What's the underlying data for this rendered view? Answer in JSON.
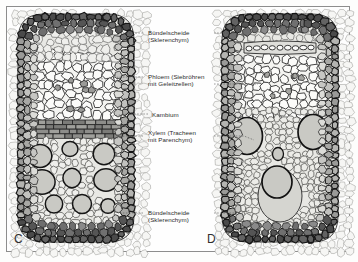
{
  "figure": {
    "background_color": "#fdfdfc",
    "frame_color": "#8d8d8d",
    "ink_color": "#2b2b2b"
  },
  "palette": {
    "sclerenchym_dark": "#3a3a3a",
    "sclerenchym_mid": "#8f8f8f",
    "parenchym_light": "#e8e8e4",
    "phloem_pale": "#f4f4f1",
    "xylem_fill": "#c9c9c4",
    "kambium_fill": "#9a9a96",
    "cavity_fill": "#d5d5d0",
    "outline": "#1e1e1e"
  },
  "labels": [
    {
      "id": "label-buendelscheide-top",
      "name": "Bündelscheide (Sklerenchym)",
      "lines": [
        "Bündelscheide",
        "(Sklerenchym)"
      ],
      "x": 148,
      "y": 29
    },
    {
      "id": "label-phloem",
      "name": "Phloem (Siebröhren mit Geleitzellen)",
      "lines": [
        "Phloem (Siebröhren",
        "mit Geleitzellen)"
      ],
      "x": 148,
      "y": 73
    },
    {
      "id": "label-kambium",
      "name": "Kambium",
      "lines": [
        "Kambium"
      ],
      "x": 152,
      "y": 111
    },
    {
      "id": "label-xylem",
      "name": "Xylem (Tracheen mit Parenchym)",
      "lines": [
        "Xylem (Tracheen",
        "mit Parenchym)"
      ],
      "x": 148,
      "y": 129
    },
    {
      "id": "label-buendelscheide-bottom",
      "name": "Bündelscheide (Sklerenchym)",
      "lines": [
        "Bündelscheide",
        "(Sklerenchym)"
      ],
      "x": 148,
      "y": 209
    }
  ],
  "panels": [
    {
      "id": "panel-c",
      "letter": "C",
      "letter_x": 14,
      "letter_y": 232
    },
    {
      "id": "panel-d",
      "letter": "D",
      "letter_x": 207,
      "letter_y": 232
    }
  ],
  "leader_lines": [
    {
      "id": "leader-sheath-top-left",
      "points": "143,33 120,33 112,36"
    },
    {
      "id": "leader-sheath-top-right",
      "points": "214,33 238,33 246,38"
    },
    {
      "id": "leader-phloem-left",
      "points": "143,77 120,77 100,79"
    },
    {
      "id": "leader-phloem-right",
      "points": "214,84 240,84 258,84"
    },
    {
      "id": "leader-kambium-left",
      "points": "148,114 128,114 112,116"
    },
    {
      "id": "leader-xylem-left",
      "points": "143,136 124,136 110,140"
    },
    {
      "id": "leader-xylem-right",
      "points": "214,136 244,136 254,140"
    },
    {
      "id": "leader-sheath-bot-left",
      "points": "143,213 122,213 110,211"
    },
    {
      "id": "leader-sheath-bot-right",
      "points": "214,213 240,213 250,210"
    }
  ],
  "chart_data": {
    "type": "diagram",
    "panels": [
      {
        "letter": "C",
        "description": "Leitbündel eines dikotylen Stängels mit Kambium",
        "bounds": {
          "x": 18,
          "y": 14,
          "w": 116,
          "h": 228
        },
        "tissues": [
          {
            "name": "Bündelscheide (Sklerenchym)",
            "region": "ring",
            "tone": "dark"
          },
          {
            "name": "Phloem (Siebröhren mit Geleitzellen)",
            "region": "upper",
            "tone": "pale"
          },
          {
            "name": "Kambium",
            "region": "band",
            "tone": "mid"
          },
          {
            "name": "Xylem (Tracheen mit Parenchym)",
            "region": "lower",
            "tone": "light"
          }
        ],
        "vessel_count": 9
      },
      {
        "letter": "D",
        "description": "Leitbündel eines monokotylen Halms ohne Kambium",
        "bounds": {
          "x": 222,
          "y": 14,
          "w": 116,
          "h": 228
        },
        "tissues": [
          {
            "name": "Bündelscheide (Sklerenchym)",
            "region": "ring",
            "tone": "dark"
          },
          {
            "name": "Phloem (Siebröhren mit Geleitzellen)",
            "region": "upper",
            "tone": "pale"
          },
          {
            "name": "Xylem (Tracheen mit Parenchym)",
            "region": "lower",
            "tone": "light"
          }
        ],
        "vessel_count": 3,
        "has_air_cavity": true
      }
    ]
  }
}
